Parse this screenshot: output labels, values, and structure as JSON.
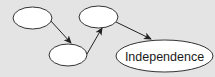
{
  "diagram": {
    "type": "flow",
    "colors": {
      "background": "#e4e4e4",
      "node_fill": "#ffffff",
      "node_stroke": "#333333",
      "arrow": "#222222",
      "text": "#1a1a1a"
    },
    "nodes": [
      {
        "id": "node-1",
        "label": ""
      },
      {
        "id": "node-2",
        "label": ""
      },
      {
        "id": "node-3",
        "label": ""
      },
      {
        "id": "node-4",
        "label": "Independence"
      }
    ],
    "edges": [
      {
        "from": "node-1",
        "to": "node-2"
      },
      {
        "from": "node-2",
        "to": "node-3"
      },
      {
        "from": "node-3",
        "to": "node-4"
      }
    ]
  }
}
